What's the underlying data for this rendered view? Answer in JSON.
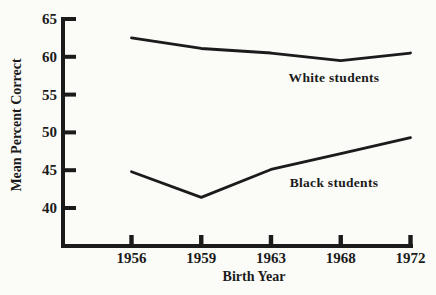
{
  "chart_data": {
    "type": "line",
    "title": "",
    "xlabel": "Birth Year",
    "ylabel": "Mean Percent Correct",
    "categories": [
      "1956",
      "1959",
      "1963",
      "1968",
      "1972"
    ],
    "series": [
      {
        "name": "White students",
        "values": [
          62.5,
          61.1,
          60.5,
          59.5,
          60.5
        ]
      },
      {
        "name": "Black students",
        "values": [
          44.8,
          41.4,
          45.1,
          47.2,
          49.3
        ]
      }
    ],
    "y_ticks": [
      65,
      60,
      55,
      50,
      45,
      40
    ],
    "ylim": [
      40,
      65
    ],
    "grid": false,
    "legend": "inline-labels",
    "line_color": "#1b1b1b",
    "background": "#fbfbf8"
  }
}
